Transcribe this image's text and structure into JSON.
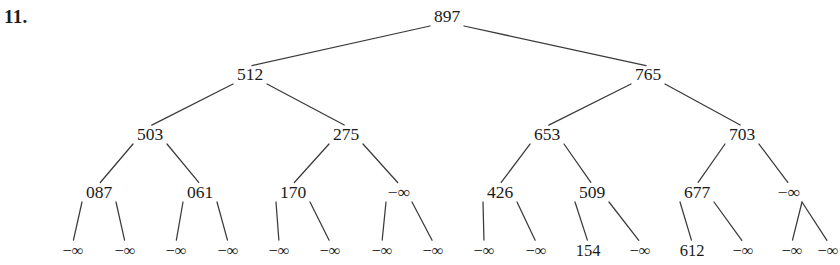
{
  "problem": {
    "number_label": "11."
  },
  "diagram": {
    "type": "binary-tree",
    "neg_infinity_glyph": "−∞",
    "levels": [
      {
        "level": 0,
        "y": 22,
        "nodes": [
          {
            "id": "n0",
            "label": "897",
            "x": 447
          }
        ]
      },
      {
        "level": 1,
        "y": 80,
        "nodes": [
          {
            "id": "n1",
            "label": "512",
            "x": 250
          },
          {
            "id": "n2",
            "label": "765",
            "x": 648
          }
        ]
      },
      {
        "level": 2,
        "y": 140,
        "nodes": [
          {
            "id": "n3",
            "label": "503",
            "x": 150
          },
          {
            "id": "n4",
            "label": "275",
            "x": 346
          },
          {
            "id": "n5",
            "label": "653",
            "x": 547
          },
          {
            "id": "n6",
            "label": "703",
            "x": 742
          }
        ]
      },
      {
        "level": 3,
        "y": 198,
        "nodes": [
          {
            "id": "n7",
            "label": "087",
            "x": 99
          },
          {
            "id": "n8",
            "label": "061",
            "x": 200
          },
          {
            "id": "n9",
            "label": "170",
            "x": 293
          },
          {
            "id": "n10",
            "label": "−∞",
            "x": 399
          },
          {
            "id": "n11",
            "label": "426",
            "x": 500
          },
          {
            "id": "n12",
            "label": "509",
            "x": 592
          },
          {
            "id": "n13",
            "label": "677",
            "x": 697
          },
          {
            "id": "n14",
            "label": "−∞",
            "x": 789
          }
        ]
      },
      {
        "level": 4,
        "y": 256,
        "nodes": [
          {
            "id": "l0",
            "label": "−∞",
            "x": 73
          },
          {
            "id": "l1",
            "label": "−∞",
            "x": 125
          },
          {
            "id": "l2",
            "label": "−∞",
            "x": 176
          },
          {
            "id": "l3",
            "label": "−∞",
            "x": 228
          },
          {
            "id": "l4",
            "label": "−∞",
            "x": 279
          },
          {
            "id": "l5",
            "label": "−∞",
            "x": 330
          },
          {
            "id": "l6",
            "label": "−∞",
            "x": 382
          },
          {
            "id": "l7",
            "label": "−∞",
            "x": 433
          },
          {
            "id": "l8",
            "label": "−∞",
            "x": 484
          },
          {
            "id": "l9",
            "label": "−∞",
            "x": 536
          },
          {
            "id": "l10",
            "label": "154",
            "x": 588
          },
          {
            "id": "l11",
            "label": "−∞",
            "x": 640
          },
          {
            "id": "l12",
            "label": "612",
            "x": 692
          },
          {
            "id": "l13",
            "label": "−∞",
            "x": 743
          },
          {
            "id": "l14",
            "label": "−∞",
            "x": 792
          },
          {
            "id": "l15",
            "label": "−∞",
            "x": 828
          }
        ]
      }
    ],
    "edges": [
      {
        "from": "n0",
        "to": "n1"
      },
      {
        "from": "n0",
        "to": "n2"
      },
      {
        "from": "n1",
        "to": "n3"
      },
      {
        "from": "n1",
        "to": "n4"
      },
      {
        "from": "n2",
        "to": "n5"
      },
      {
        "from": "n2",
        "to": "n6"
      },
      {
        "from": "n3",
        "to": "n7"
      },
      {
        "from": "n3",
        "to": "n8"
      },
      {
        "from": "n4",
        "to": "n9"
      },
      {
        "from": "n4",
        "to": "n10"
      },
      {
        "from": "n5",
        "to": "n11"
      },
      {
        "from": "n5",
        "to": "n12"
      },
      {
        "from": "n6",
        "to": "n13"
      },
      {
        "from": "n6",
        "to": "n14"
      },
      {
        "from": "n7",
        "to": "l0"
      },
      {
        "from": "n7",
        "to": "l1"
      },
      {
        "from": "n8",
        "to": "l2"
      },
      {
        "from": "n8",
        "to": "l3"
      },
      {
        "from": "n9",
        "to": "l4"
      },
      {
        "from": "n9",
        "to": "l5"
      },
      {
        "from": "n10",
        "to": "l6"
      },
      {
        "from": "n10",
        "to": "l7"
      },
      {
        "from": "n11",
        "to": "l8"
      },
      {
        "from": "n11",
        "to": "l9"
      },
      {
        "from": "n12",
        "to": "l10"
      },
      {
        "from": "n12",
        "to": "l11"
      },
      {
        "from": "n13",
        "to": "l12"
      },
      {
        "from": "n13",
        "to": "l13"
      },
      {
        "from": "n14",
        "to": "l14"
      },
      {
        "from": "n14",
        "to": "l15"
      }
    ],
    "style": {
      "edge_color": "#3a3a3a",
      "text_color": "#1a1a1a",
      "background": "#ffffff"
    }
  }
}
